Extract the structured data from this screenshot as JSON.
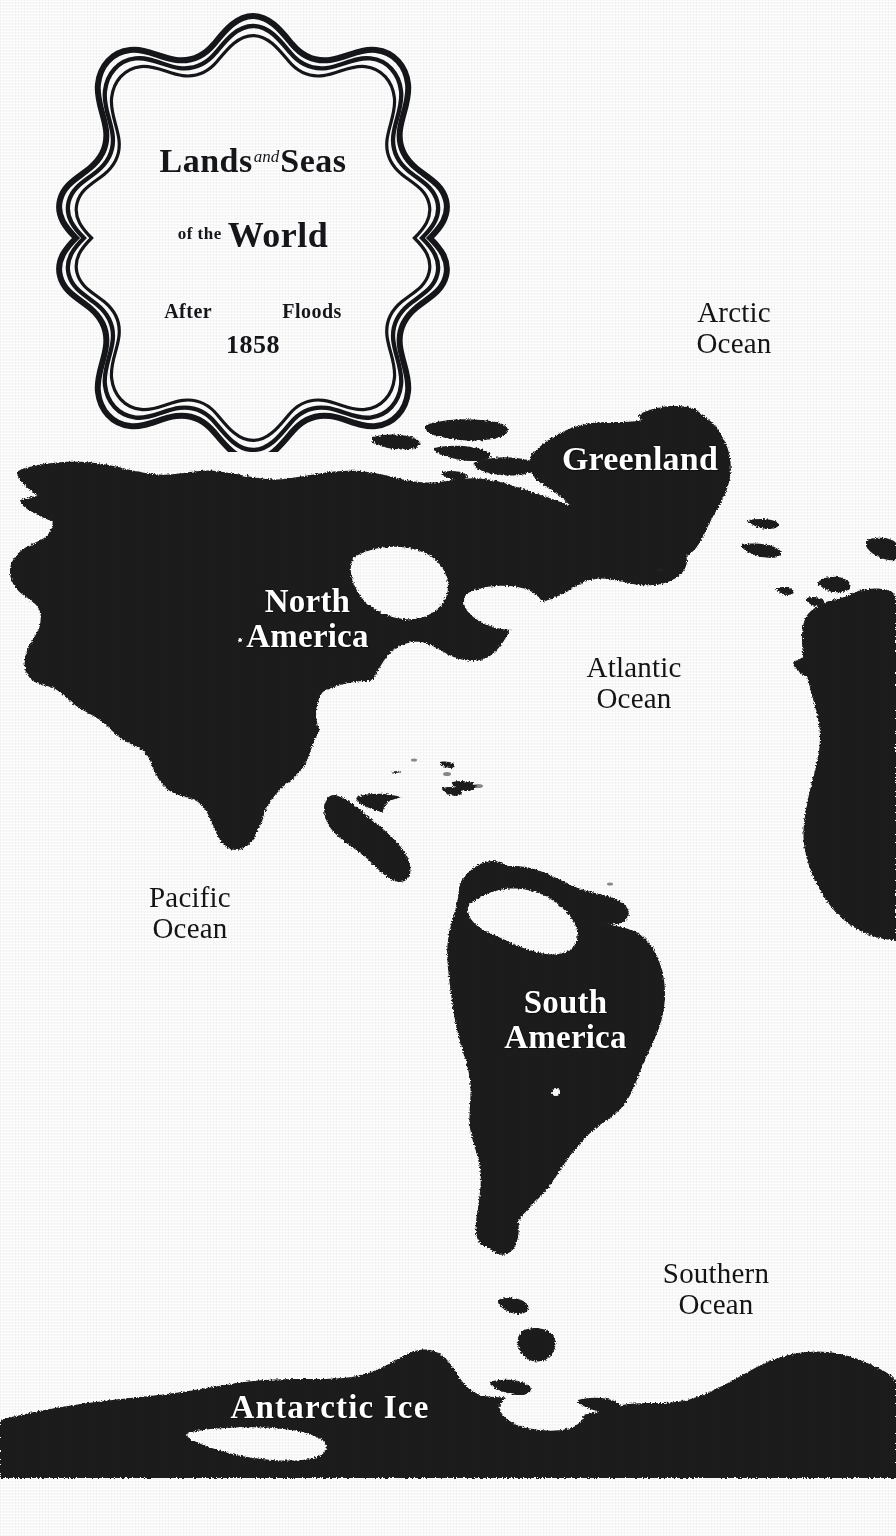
{
  "document": {
    "kind": "antique-map-plate",
    "page_background": "#ffffff",
    "land_color": "#1b1b1d",
    "sea_color": "#ffffff",
    "ink_color": "#15161a",
    "land_label_color": "#ffffff"
  },
  "cartouche": {
    "title_line_1_a": "Lands",
    "title_line_1_and": "and",
    "title_line_1_b": "Seas",
    "title_line_2_of_the": "of the",
    "title_line_2_main": "World",
    "subtitle_after": "After",
    "subtitle_floods": "Floods",
    "year": "1858",
    "border_rings": 3
  },
  "labels": [
    {
      "id": "arctic-ocean",
      "text": "Arctic\nOcean",
      "x": 639,
      "y": 297,
      "w": 190,
      "size": 29,
      "kind": "ocean"
    },
    {
      "id": "atlantic-ocean",
      "text": "Atlantic\nOcean",
      "x": 539,
      "y": 652,
      "w": 190,
      "size": 29,
      "kind": "ocean"
    },
    {
      "id": "pacific-ocean",
      "text": "Pacific\nOcean",
      "x": 95,
      "y": 882,
      "w": 190,
      "size": 29,
      "kind": "ocean"
    },
    {
      "id": "southern-ocean",
      "text": "Southern\nOcean",
      "x": 621,
      "y": 1258,
      "w": 190,
      "size": 29,
      "kind": "ocean"
    },
    {
      "id": "greenland",
      "text": "Greenland",
      "x": 485,
      "y": 441,
      "w": 310,
      "size": 34,
      "kind": "land"
    },
    {
      "id": "north-america",
      "text": "North\nAmerica",
      "x": 200,
      "y": 584,
      "w": 215,
      "size": 33,
      "kind": "land"
    },
    {
      "id": "south-america",
      "text": "South\nAmerica",
      "x": 458,
      "y": 985,
      "w": 215,
      "size": 33,
      "kind": "land"
    },
    {
      "id": "antarctic-ice",
      "text": "Antarctic  Ice",
      "x": 170,
      "y": 1390,
      "w": 320,
      "size": 33,
      "kind": "land"
    }
  ],
  "landmasses": [
    {
      "id": "north-america",
      "name": "North America"
    },
    {
      "id": "south-america",
      "name": "South America"
    },
    {
      "id": "greenland",
      "name": "Greenland"
    },
    {
      "id": "arctic-islands",
      "name": "Arctic Archipelago"
    },
    {
      "id": "caribbean",
      "name": "Caribbean Islands"
    },
    {
      "id": "europe-africa",
      "name": "Europe and Africa (west margin)"
    },
    {
      "id": "antarctic-ice",
      "name": "Antarctic Ice"
    },
    {
      "id": "inland-sea-amazon",
      "name": "Flooded Amazon Basin"
    }
  ]
}
